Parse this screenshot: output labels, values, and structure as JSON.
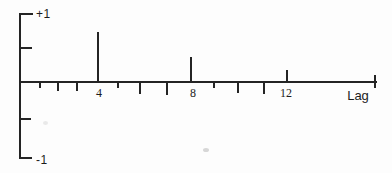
{
  "figure": {
    "y_axis": {
      "top_label": "+1",
      "bottom_label": "-1"
    },
    "x_axis": {
      "label": "Lag",
      "tick_labels": [
        "4",
        "8",
        "12"
      ]
    },
    "colors": {
      "line": "#242424",
      "background": "#fdfdfd"
    }
  },
  "chart_data": {
    "type": "bar",
    "subtype": "stem-correlogram",
    "title": "",
    "xlabel": "Lag",
    "ylabel": "",
    "ylim": [
      -1,
      1
    ],
    "x": [
      1,
      2,
      3,
      4,
      5,
      6,
      7,
      8,
      9,
      10,
      11,
      12
    ],
    "values": [
      -0.07,
      -0.1,
      -0.1,
      0.72,
      -0.07,
      -0.14,
      -0.16,
      0.35,
      -0.07,
      -0.13,
      -0.15,
      0.16
    ],
    "x_ticks_labeled": [
      4,
      8,
      12
    ],
    "y_ticks": [
      1,
      0.5,
      -0.5,
      -1
    ],
    "y_tick_labels_shown": [
      "+1",
      "-1"
    ],
    "grid": false
  }
}
